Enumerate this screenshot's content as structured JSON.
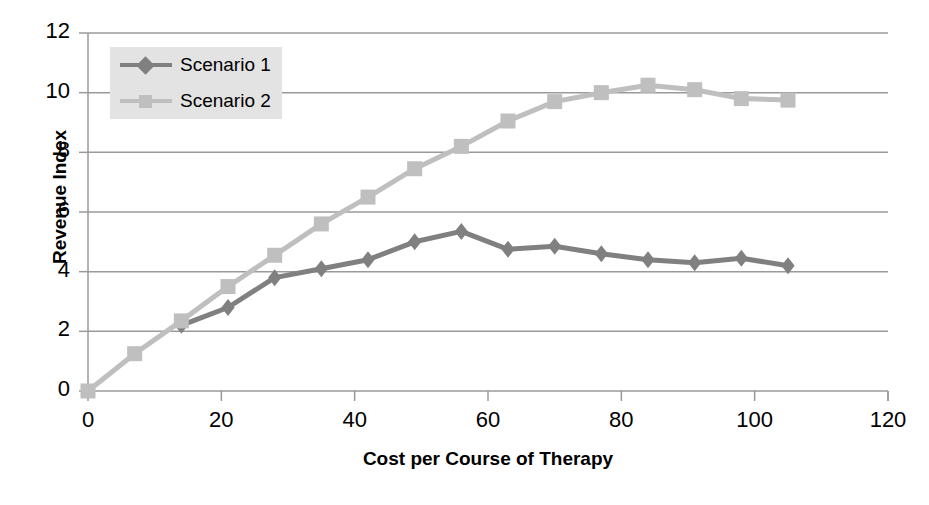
{
  "chart_data": {
    "type": "line",
    "title": "",
    "xlabel": "Cost per Course of Therapy",
    "ylabel": "Revenue Index",
    "xlim": [
      0,
      120
    ],
    "ylim": [
      0,
      12
    ],
    "xticks": [
      0,
      20,
      40,
      60,
      80,
      100,
      120
    ],
    "yticks": [
      0,
      2,
      4,
      6,
      8,
      10,
      12
    ],
    "grid": "horizontal",
    "legend_position": "upper-left-inside",
    "series": [
      {
        "name": "Scenario 1",
        "color": "#808080",
        "marker": "diamond",
        "x": [
          14,
          21,
          28,
          35,
          42,
          49,
          56,
          63,
          70,
          77,
          84,
          91,
          98,
          105
        ],
        "values": [
          2.2,
          2.8,
          3.8,
          4.1,
          4.4,
          5.0,
          5.35,
          4.75,
          4.85,
          4.6,
          4.4,
          4.3,
          4.45,
          4.2
        ]
      },
      {
        "name": "Scenario 2",
        "color": "#bfbfbf",
        "marker": "square",
        "x": [
          0,
          7,
          14,
          21,
          28,
          35,
          42,
          49,
          56,
          63,
          70,
          77,
          84,
          91,
          98,
          105
        ],
        "values": [
          0.0,
          1.25,
          2.35,
          3.5,
          4.55,
          5.6,
          6.5,
          7.45,
          8.2,
          9.05,
          9.7,
          10.0,
          10.25,
          10.1,
          9.8,
          9.75
        ]
      }
    ]
  },
  "legend": {
    "items": [
      {
        "label": "Scenario 1"
      },
      {
        "label": "Scenario 2"
      }
    ]
  },
  "axes": {
    "y_title": "Revenue Index",
    "x_title": "Cost per Course of Therapy",
    "y_tick_labels": [
      "0",
      "2",
      "4",
      "6",
      "8",
      "10",
      "12"
    ],
    "x_tick_labels": [
      "0",
      "20",
      "40",
      "60",
      "80",
      "100",
      "120"
    ]
  },
  "colors": {
    "series1": "#808080",
    "series2": "#bfbfbf",
    "grid": "#9a9a9a",
    "axis": "#9a9a9a",
    "legend_bg": "#e3e3e3",
    "text": "#000000"
  }
}
